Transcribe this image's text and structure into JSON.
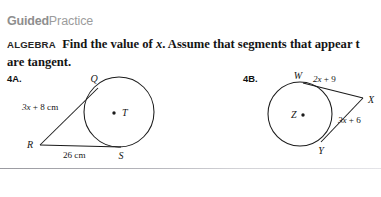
{
  "header": {
    "title_bold": "Guided",
    "title_light": "Practice"
  },
  "directions": {
    "tag": "ALGEBRA",
    "line1_a": "Find the value of ",
    "line1_var": "x",
    "line1_b": ". Assume that segments that appear t",
    "line2": "are tangent."
  },
  "problems": [
    {
      "label": "4A.",
      "center_label": "T",
      "points": [
        "Q",
        "R",
        "S"
      ],
      "measurements": [
        {
          "value": "3x + 8 cm",
          "var": "3x",
          "rest": " + 8 cm"
        },
        {
          "value": "26 cm",
          "var": "",
          "rest": "26 cm"
        }
      ]
    },
    {
      "label": "4B.",
      "center_label": "Z",
      "points": [
        "W",
        "X",
        "Y"
      ],
      "measurements": [
        {
          "value": "2x + 9",
          "var": "2x",
          "rest": " + 9"
        },
        {
          "value": "3x + 6",
          "var": "3x",
          "rest": " + 6"
        }
      ]
    }
  ],
  "colors": {
    "ink": "#161616",
    "header_gray": "#8e8e8e",
    "divider": "#b4b4ba"
  }
}
